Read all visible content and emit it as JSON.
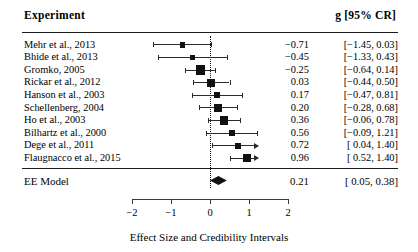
{
  "header": {
    "left_label": "Experiment",
    "right_label": "g [95% CR]"
  },
  "axis": {
    "title": "Effect Size and Credibility Intervals",
    "ticks": [
      "−2",
      "−1",
      "0",
      "1",
      "2"
    ],
    "tick_values": [
      -2,
      -1,
      0,
      1,
      2
    ],
    "xlim": [
      -2.35,
      2.1
    ],
    "zero_reference": 0
  },
  "summary": {
    "label": "EE Model",
    "estimate": "0.21",
    "ci": "[ 0.05, 0.38]",
    "value": 0.21,
    "lower": 0.05,
    "upper": 0.38
  },
  "studies": [
    {
      "label": "Mehr et al., 2013",
      "estimate": "−0.71",
      "ci": "[−1.45, 0.03]",
      "value": -0.71,
      "lower": -1.45,
      "upper": 0.03,
      "weight": 4
    },
    {
      "label": "Bhide et al., 2013",
      "estimate": "−0.45",
      "ci": "[−1.33, 0.43]",
      "value": -0.45,
      "lower": -1.33,
      "upper": 0.43,
      "weight": 3
    },
    {
      "label": "Gromko, 2005",
      "estimate": "−0.25",
      "ci": "[−0.64, 0.14]",
      "value": -0.25,
      "lower": -0.64,
      "upper": 0.14,
      "weight": 10
    },
    {
      "label": "Rickar et al., 2012",
      "estimate": "0.03",
      "ci": "[−0.44, 0.50]",
      "value": 0.03,
      "lower": -0.44,
      "upper": 0.5,
      "weight": 8
    },
    {
      "label": "Hanson et al., 2003",
      "estimate": "0.17",
      "ci": "[−0.47, 0.81]",
      "value": 0.17,
      "lower": -0.47,
      "upper": 0.81,
      "weight": 5
    },
    {
      "label": "Schellenberg, 2004",
      "estimate": "0.20",
      "ci": "[−0.28, 0.68]",
      "value": 0.2,
      "lower": -0.28,
      "upper": 0.68,
      "weight": 8
    },
    {
      "label": "Ho et al., 2003",
      "estimate": "0.36",
      "ci": "[−0.06, 0.78]",
      "value": 0.36,
      "lower": -0.06,
      "upper": 0.78,
      "weight": 9
    },
    {
      "label": "Bilhartz et al., 2000",
      "estimate": "0.56",
      "ci": "[−0.09, 1.21]",
      "value": 0.56,
      "lower": -0.09,
      "upper": 1.21,
      "weight": 5
    },
    {
      "label": "Dege et al., 2011",
      "estimate": "0.72",
      "ci": "[ 0.04, 1.40]",
      "value": 0.72,
      "lower": 0.04,
      "upper": 1.4,
      "weight": 5
    },
    {
      "label": "Flaugnacco et al., 2015",
      "estimate": "0.96",
      "ci": "[ 0.52, 1.40]",
      "value": 0.96,
      "lower": 0.52,
      "upper": 1.4,
      "weight": 8
    }
  ],
  "chart_data": {
    "type": "forest",
    "title": "",
    "xlabel": "Effect Size and Credibility Intervals",
    "ylabel": "",
    "xlim": [
      -2.35,
      2.1
    ],
    "xticks": [
      -2,
      -1,
      0,
      1,
      2
    ],
    "grid": false,
    "zero_line": 0,
    "categories": [
      "Mehr et al., 2013",
      "Bhide et al., 2013",
      "Gromko, 2005",
      "Rickar et al., 2012",
      "Hanson et al., 2003",
      "Schellenberg, 2004",
      "Ho et al., 2003",
      "Bilhartz et al., 2000",
      "Dege et al., 2011",
      "Flaugnacco et al., 2015"
    ],
    "values": [
      -0.71,
      -0.45,
      -0.25,
      0.03,
      0.17,
      0.2,
      0.36,
      0.56,
      0.72,
      0.96
    ],
    "ci_lower": [
      -1.45,
      -1.33,
      -0.64,
      -0.44,
      -0.47,
      -0.28,
      -0.06,
      -0.09,
      0.04,
      0.52
    ],
    "ci_upper": [
      0.03,
      0.43,
      0.14,
      0.5,
      0.81,
      0.68,
      0.78,
      1.21,
      1.4,
      1.4
    ],
    "summary": {
      "name": "EE Model",
      "value": 0.21,
      "ci_lower": 0.05,
      "ci_upper": 0.38
    }
  }
}
